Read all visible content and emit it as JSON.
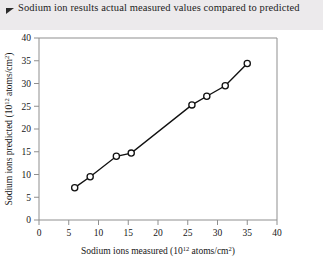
{
  "figure": {
    "caption_marker": "triangle-bullet",
    "caption": "Sodium ion results actual measured values compared to predicted",
    "subfigure_label": "(a)"
  },
  "chart_data": {
    "type": "scatter",
    "title": "Sodium ion results actual measured values compared to predicted",
    "xlabel_text": "Sodium ions measured (10",
    "xlabel_sup": "12",
    "xlabel_tail": " atoms/cm",
    "xlabel_sup2": "2",
    "xlabel_end": ")",
    "ylabel_text": "Sodium ions predicted (10",
    "ylabel_sup": "12",
    "ylabel_tail": " atoms/cm",
    "ylabel_sup2": "2",
    "ylabel_end": ")",
    "xlim": [
      0,
      40
    ],
    "ylim": [
      0,
      40
    ],
    "xticks": [
      0,
      5,
      10,
      15,
      20,
      25,
      30,
      35,
      40
    ],
    "yticks": [
      0,
      5,
      10,
      15,
      20,
      25,
      30,
      35,
      40
    ],
    "grid": false,
    "legend": "none",
    "marker_style": "open-circle",
    "line_color": "#111111",
    "marker_face_color": "#ffffff",
    "axis_color": "#8f8f8f",
    "series": [
      {
        "name": "measured vs predicted",
        "x": [
          6.0,
          8.6,
          13.0,
          15.5,
          25.7,
          28.2,
          31.3,
          35.0
        ],
        "y": [
          7.1,
          9.5,
          14.0,
          14.7,
          25.3,
          27.2,
          29.5,
          34.4
        ]
      }
    ]
  }
}
